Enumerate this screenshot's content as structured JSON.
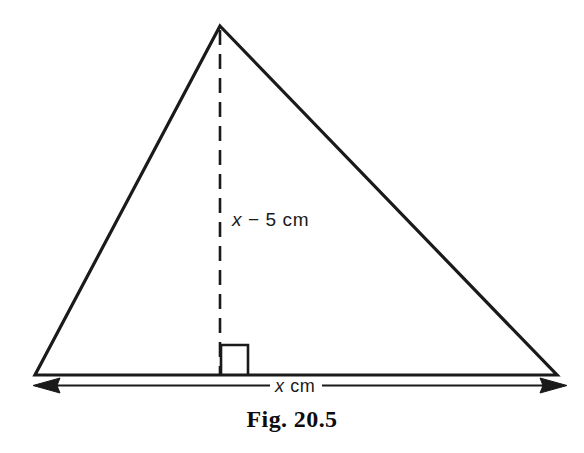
{
  "figure": {
    "caption": "Fig. 20.5",
    "background_color": "#ffffff",
    "stroke_color": "#1a1a1a"
  },
  "labels": {
    "height": {
      "variable": "x",
      "rest": " − 5 cm",
      "full": "x − 5 cm"
    },
    "base": {
      "variable": "x",
      "rest": " cm",
      "full": "x cm"
    }
  },
  "geometry": {
    "shape": "triangle",
    "apex": {
      "x": 220,
      "y": 26
    },
    "bottom_left": {
      "x": 35,
      "y": 375
    },
    "bottom_right": {
      "x": 557,
      "y": 375
    },
    "altitude_foot": {
      "x": 220,
      "y": 375
    },
    "altitude_style": "dashed",
    "right_angle_marker": {
      "x": 220,
      "y": 344,
      "size": 28
    },
    "dimension_line": {
      "x1": 33,
      "x2": 567,
      "y": 385,
      "arrows": "both"
    }
  }
}
